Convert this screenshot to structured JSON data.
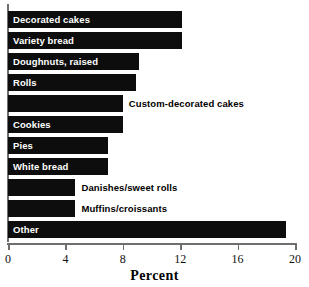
{
  "chart_data": {
    "type": "bar",
    "orientation": "horizontal",
    "title": "",
    "xlabel": "Percent",
    "ylabel": "",
    "xlim": [
      0,
      20
    ],
    "xticks": [
      0,
      4,
      8,
      12,
      16,
      20
    ],
    "xtick_labels": [
      "0",
      "4",
      "8",
      "12",
      "16",
      "20"
    ],
    "grid": false,
    "legend": null,
    "bar_color": "#0d0d0d",
    "axis_color": "#6e6e6e",
    "inside_label_color": "#ffffff",
    "outside_label_color": "#000000",
    "categories": [
      "Decorated cakes",
      "Variety bread",
      "Doughnuts, raised",
      "Rolls",
      "Custom-decorated cakes",
      "Cookies",
      "Pies",
      "White bread",
      "Danishes/sweet rolls",
      "Muffins/croissants",
      "Other"
    ],
    "values": [
      12.1,
      12.1,
      9.1,
      8.9,
      8.0,
      8.0,
      7.0,
      7.0,
      4.7,
      4.7,
      19.4
    ],
    "label_placement": [
      "inside",
      "inside",
      "inside",
      "inside",
      "outside",
      "inside",
      "inside",
      "inside",
      "outside",
      "outside",
      "inside"
    ]
  }
}
